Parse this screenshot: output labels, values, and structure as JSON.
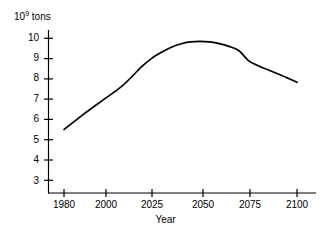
{
  "chart_data": {
    "type": "line",
    "title": "",
    "subtitle": "",
    "xlabel": "Year",
    "ylabel": "10^9 tons",
    "ylabel_mantissa": "10",
    "ylabel_exponent": "9",
    "ylabel_unit": " tons",
    "grid": false,
    "legend": null,
    "legend_position": "none",
    "xlim": [
      1972,
      2110
    ],
    "ylim": [
      2.6,
      10.4
    ],
    "xticks": [
      1980,
      2000,
      2025,
      2050,
      2075,
      2100
    ],
    "xtick_labels": [
      "1980",
      "2000",
      "2025",
      "2050",
      "2075",
      "2100"
    ],
    "yticks": [
      3,
      4,
      5,
      6,
      7,
      8,
      9,
      10
    ],
    "ytick_labels": [
      "3",
      "4",
      "5",
      "6",
      "7",
      "8",
      "9",
      "10"
    ],
    "x": [
      1980,
      1990,
      2000,
      2010,
      2020,
      2025,
      2030,
      2035,
      2040,
      2045,
      2050,
      2055,
      2060,
      2065,
      2070,
      2075,
      2080,
      2085,
      2090,
      2095,
      2100
    ],
    "values": [
      5.5,
      6.25,
      6.95,
      7.65,
      8.6,
      9.0,
      9.3,
      9.55,
      9.72,
      9.82,
      9.85,
      9.82,
      9.74,
      9.6,
      9.4,
      8.9,
      8.65,
      8.45,
      8.25,
      8.05,
      7.83
    ],
    "series": [
      {
        "name": "World production",
        "color": "#000000",
        "values": [
          5.5,
          6.25,
          6.95,
          7.65,
          8.6,
          9.0,
          9.3,
          9.55,
          9.72,
          9.82,
          9.85,
          9.82,
          9.74,
          9.6,
          9.4,
          8.9,
          8.65,
          8.45,
          8.25,
          8.05,
          7.83
        ]
      }
    ],
    "annotations": [],
    "axis_color": "#000000",
    "background_color": "#ffffff"
  },
  "axes": {
    "y_unit_mantissa": "10",
    "y_unit_exponent": "9",
    "y_unit_text": " tons",
    "x_title": "Year"
  }
}
